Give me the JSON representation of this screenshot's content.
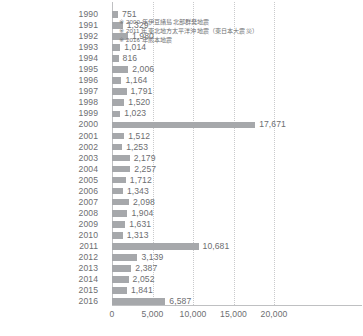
{
  "chart_data": {
    "type": "bar",
    "orientation": "horizontal",
    "title": "",
    "subtitle": "",
    "xlabel": "",
    "ylabel": "",
    "xlim": [
      0,
      20000
    ],
    "xticks": [
      0,
      5000,
      10000,
      15000,
      20000
    ],
    "xtick_labels": [
      "0",
      "5,000",
      "10,000",
      "15,000",
      "20,000"
    ],
    "grid": true,
    "grid_axis": "x",
    "legend": "none",
    "bar_color": "#a6a8ab",
    "text_color": "#6d6e71",
    "categories": [
      "1990",
      "1991",
      "1992",
      "1993",
      "1994",
      "1995",
      "1996",
      "1997",
      "1998",
      "1999",
      "2000",
      "2001",
      "2002",
      "2003",
      "2004",
      "2005",
      "2006",
      "2007",
      "2008",
      "2009",
      "2010",
      "2011",
      "2012",
      "2013",
      "2014",
      "2015",
      "2016"
    ],
    "values": [
      751,
      1329,
      1980,
      1014,
      816,
      2006,
      1164,
      1791,
      1520,
      1023,
      17671,
      1512,
      1253,
      2179,
      2257,
      1712,
      1343,
      2098,
      1904,
      1631,
      1313,
      10681,
      3139,
      2387,
      2052,
      1841,
      6587
    ],
    "value_labels": [
      "751",
      "1,329",
      "1,980",
      "1,014",
      "816",
      "2,006",
      "1,164",
      "1,791",
      "1,520",
      "1,023",
      "17,671",
      "1,512",
      "1,253",
      "2,179",
      "2,257",
      "1,712",
      "1,343",
      "2,098",
      "1,904",
      "1,631",
      "1,313",
      "10,681",
      "3,139",
      "2,387",
      "2,052",
      "1,841",
      "6,587"
    ],
    "annotations": [
      "※ 2000 年伊豆諸島北部群発地震",
      "※ 2011 年東北地方太平洋沖地震（東日本大震災）",
      "※ 2016 年熊本地震"
    ]
  }
}
